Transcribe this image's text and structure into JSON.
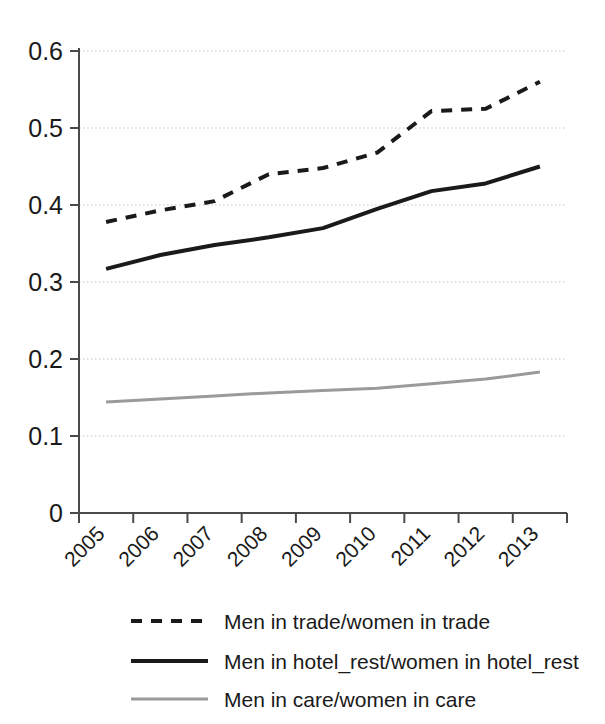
{
  "chart_data": {
    "type": "line",
    "title": "",
    "subtitle": "",
    "xlabel": "",
    "ylabel": "",
    "categories": [
      "2005",
      "2006",
      "2007",
      "2008",
      "2009",
      "2010",
      "2011",
      "2012",
      "2013"
    ],
    "x": [
      2005,
      2006,
      2007,
      2008,
      2009,
      2010,
      2011,
      2012,
      2013
    ],
    "ylim": [
      0,
      0.6
    ],
    "yticks": [
      "0",
      "0.1",
      "0.2",
      "0.3",
      "0.4",
      "0.5",
      "0.6"
    ],
    "ytick_values": [
      0,
      0.1,
      0.2,
      0.3,
      0.4,
      0.5,
      0.6
    ],
    "grid": "horizontal-dotted",
    "legend_position": "bottom",
    "series": [
      {
        "name": "Men in trade/women in trade",
        "style": "dashed",
        "color": "#1a1a1a",
        "values": [
          0.378,
          0.393,
          0.405,
          0.44,
          0.448,
          0.468,
          0.522,
          0.525,
          0.56
        ]
      },
      {
        "name": "Men in hotel_rest/women in hotel_rest",
        "style": "solid",
        "color": "#1a1a1a",
        "values": [
          0.317,
          0.335,
          0.348,
          0.358,
          0.37,
          0.395,
          0.418,
          0.428,
          0.45
        ]
      },
      {
        "name": "Men in care/women in care",
        "style": "solid-light",
        "color": "#9a9a9a",
        "values": [
          0.144,
          0.148,
          0.152,
          0.156,
          0.159,
          0.162,
          0.168,
          0.174,
          0.183
        ]
      }
    ]
  },
  "axes": {
    "y_labels": [
      "0.6",
      "0.5",
      "0.4",
      "0.3",
      "0.2",
      "0.1",
      "0"
    ],
    "x_labels": [
      "2005",
      "2006",
      "2007",
      "2008",
      "2009",
      "2010",
      "2011",
      "2012",
      "2013"
    ],
    "axis_color": "#4a4a4a",
    "grid_color": "#d8d8d8"
  },
  "legend": {
    "entries": [
      {
        "label": "Men in trade/women in trade",
        "swatch": "dashed-line-swatch"
      },
      {
        "label": "Men in hotel_rest/women in hotel_rest",
        "swatch": "solid-line-swatch"
      },
      {
        "label": "Men in care/women in care",
        "swatch": "light-line-swatch"
      }
    ]
  }
}
